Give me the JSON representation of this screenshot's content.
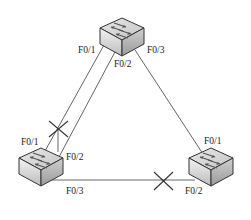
{
  "diagram": {
    "type": "network-topology",
    "colors": {
      "line": "#555555",
      "switch_top": "#d8d8d8",
      "switch_side": "#b8b8b8",
      "switch_front": "#e6e6e6",
      "blocked_mark": "#333333"
    },
    "switches": [
      {
        "id": "top",
        "name": "switch-top"
      },
      {
        "id": "left",
        "name": "switch-left"
      },
      {
        "id": "right",
        "name": "switch-right"
      }
    ],
    "labels": {
      "top_f01": "F0/1",
      "top_f02": "F0/2",
      "top_f03": "F0/3",
      "left_f01": "F0/1",
      "left_f02": "F0/2",
      "left_f03": "F0/3",
      "right_f01": "F0/1",
      "right_f02": "F0/2"
    },
    "links": [
      {
        "from": "top:F0/1",
        "to": "left:F0/1",
        "blocked": true
      },
      {
        "from": "top:F0/2",
        "to": "left:F0/2",
        "blocked": false
      },
      {
        "from": "top:F0/3",
        "to": "right:F0/1",
        "blocked": false
      },
      {
        "from": "left:F0/3",
        "to": "right:F0/2",
        "blocked": true
      }
    ]
  }
}
